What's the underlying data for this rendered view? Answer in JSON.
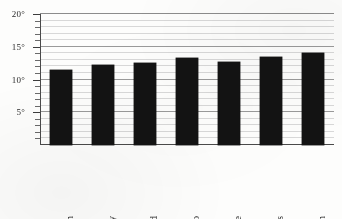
{
  "chart_data": {
    "type": "bar",
    "title": "",
    "xlabel": "",
    "ylabel": "",
    "categories": [
      "Aberdeen",
      "Derry",
      "Sunderland",
      "Llandudno",
      "Rosslare",
      "Cowes",
      "Falmouth"
    ],
    "values": [
      11.5,
      12.2,
      12.5,
      13.3,
      12.6,
      13.4,
      14.0
    ],
    "unit": "°",
    "ylim": [
      0,
      20
    ],
    "y_major_ticks": [
      5,
      10,
      15,
      20
    ],
    "y_minor_tick_step": 1,
    "y_tick_labels": [
      "5°",
      "10°",
      "15°",
      "20°"
    ],
    "grid": true,
    "legend": "none",
    "bar_color": "#131313",
    "grid_color": "#d8d8d8",
    "axis_color": "#4a4a4a"
  }
}
